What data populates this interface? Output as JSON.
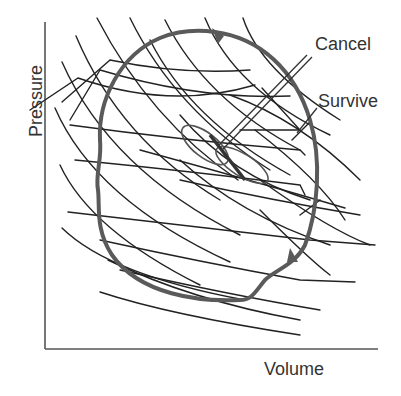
{
  "figure": {
    "type": "pv-diagram",
    "labels": {
      "cancel": "Cancel",
      "survive": "Survive",
      "x_axis": "Volume",
      "y_axis": "Pressure"
    },
    "colors": {
      "thin_lines": "#222222",
      "loop": "#5a5a5a",
      "axes": "#555555",
      "text": "#333333",
      "background": "#ffffff"
    },
    "axes": {
      "origin": [
        45,
        349
      ],
      "y_top": [
        45,
        22
      ],
      "x_right": [
        378,
        349
      ]
    }
  }
}
